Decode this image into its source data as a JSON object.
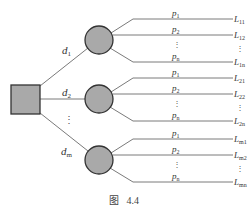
{
  "diagram": {
    "type": "decision-tree",
    "caption": "图   4.4",
    "colors": {
      "node_fill": "#a9a9a9",
      "node_stroke": "#333333",
      "line": "#7a7a7a",
      "text": "#333333"
    },
    "root": {
      "shape": "square",
      "label": ""
    },
    "decisions": [
      {
        "label": "d1",
        "label_main": "d",
        "label_sub": "1",
        "branches": [
          {
            "prob_main": "p",
            "prob_sub": "1",
            "loss_main": "L",
            "loss_sub": "11"
          },
          {
            "prob_main": "p",
            "prob_sub": "2",
            "loss_main": "L",
            "loss_sub": "12"
          },
          {
            "prob_main": "p",
            "prob_sub": "n",
            "loss_main": "L",
            "loss_sub": "1n"
          }
        ]
      },
      {
        "label": "d2",
        "label_main": "d",
        "label_sub": "2",
        "branches": [
          {
            "prob_main": "p",
            "prob_sub": "1",
            "loss_main": "L",
            "loss_sub": "21"
          },
          {
            "prob_main": "p",
            "prob_sub": "2",
            "loss_main": "L",
            "loss_sub": "22"
          },
          {
            "prob_main": "p",
            "prob_sub": "n",
            "loss_main": "L",
            "loss_sub": "2n"
          }
        ]
      },
      {
        "label": "dm",
        "label_main": "d",
        "label_sub": "m",
        "branches": [
          {
            "prob_main": "p",
            "prob_sub": "1",
            "loss_main": "L",
            "loss_sub": "m1"
          },
          {
            "prob_main": "p",
            "prob_sub": "2",
            "loss_main": "L",
            "loss_sub": "m2"
          },
          {
            "prob_main": "p",
            "prob_sub": "n",
            "loss_main": "L",
            "loss_sub": "mn"
          }
        ]
      }
    ],
    "ellipsis": "⋮"
  }
}
